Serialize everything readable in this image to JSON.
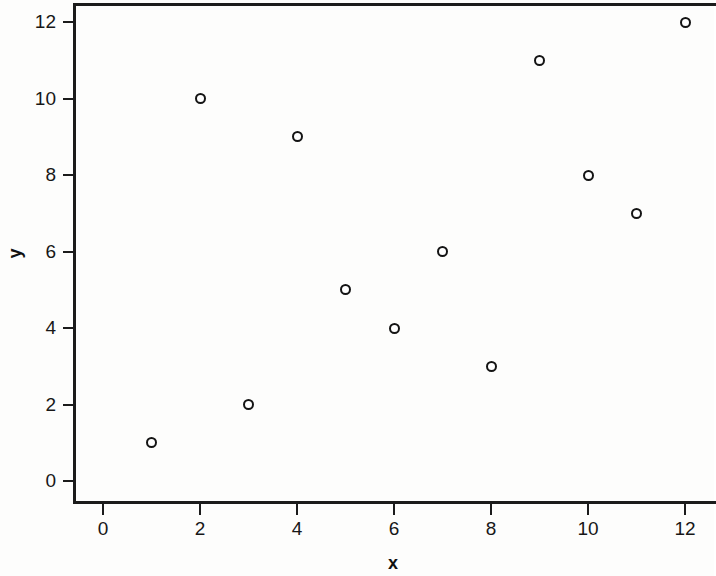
{
  "chart_data": {
    "type": "scatter",
    "title": "",
    "xlabel": "x",
    "ylabel": "y",
    "x": [
      1,
      2,
      3,
      4,
      5,
      6,
      7,
      8,
      9,
      10,
      11,
      12
    ],
    "y": [
      1,
      10,
      2,
      9,
      5,
      4,
      6,
      3,
      11,
      8,
      7,
      12
    ],
    "points": [
      {
        "x": 1,
        "y": 1
      },
      {
        "x": 2,
        "y": 10
      },
      {
        "x": 3,
        "y": 2
      },
      {
        "x": 4,
        "y": 9
      },
      {
        "x": 5,
        "y": 5
      },
      {
        "x": 6,
        "y": 4
      },
      {
        "x": 7,
        "y": 6
      },
      {
        "x": 8,
        "y": 3
      },
      {
        "x": 9,
        "y": 11
      },
      {
        "x": 10,
        "y": 8
      },
      {
        "x": 11,
        "y": 7
      },
      {
        "x": 12,
        "y": 12
      }
    ],
    "xlim": [
      -0.6,
      13.2
    ],
    "ylim": [
      -0.55,
      12.55
    ],
    "xticks": [
      0,
      2,
      4,
      6,
      8,
      10,
      12
    ],
    "xtick_labels": [
      "0",
      "2",
      "4",
      "6",
      "8",
      "10",
      "12"
    ],
    "yticks": [
      0,
      2,
      4,
      6,
      8,
      10,
      12
    ],
    "ytick_labels": [
      "0",
      "2",
      "4",
      "6",
      "8",
      "10",
      "12"
    ],
    "grid": false,
    "legend": null,
    "marker": "open-circle",
    "marker_color": "#141414",
    "background_color": "#fdfdfc",
    "axis_color": "#1b1b1b"
  }
}
